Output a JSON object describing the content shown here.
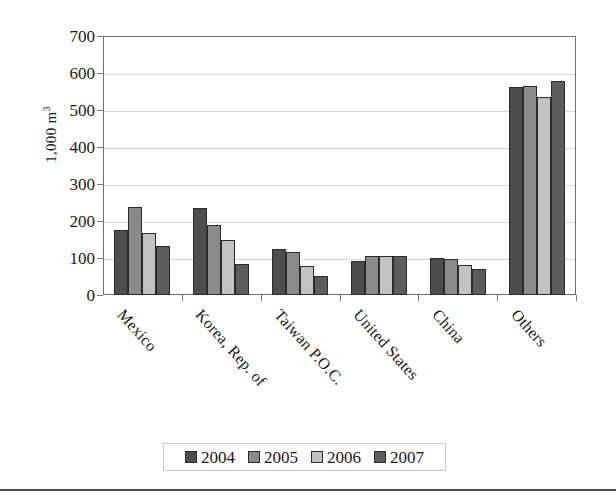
{
  "chart_data": {
    "type": "bar",
    "title": "",
    "xlabel": "",
    "ylabel": "1,000 m",
    "ylabel_superscript": "3",
    "ylim": [
      0,
      700
    ],
    "ytick_values": [
      0,
      100,
      200,
      300,
      400,
      500,
      600,
      700
    ],
    "ytick_labels": [
      "0",
      "100",
      "200",
      "300",
      "400",
      "500",
      "600",
      "700"
    ],
    "grid": true,
    "legend_position": "bottom",
    "categories": [
      "Mexico",
      "Korea, Rep. of",
      "Taiwan P.O.C.",
      "United States",
      "China",
      "Others"
    ],
    "series": [
      {
        "name": "2004",
        "color": "#4d4d4d",
        "values": [
          175,
          235,
          125,
          92,
          100,
          562
        ]
      },
      {
        "name": "2005",
        "color": "#8a8a8a",
        "values": [
          237,
          188,
          115,
          105,
          97,
          565
        ]
      },
      {
        "name": "2006",
        "color": "#c2c2c2",
        "values": [
          167,
          150,
          78,
          105,
          82,
          535
        ]
      },
      {
        "name": "2007",
        "color": "#5c5c5c",
        "values": [
          132,
          85,
          52,
          105,
          70,
          578
        ]
      }
    ]
  },
  "legend": {
    "entries": [
      "2004",
      "2005",
      "2006",
      "2007"
    ]
  }
}
